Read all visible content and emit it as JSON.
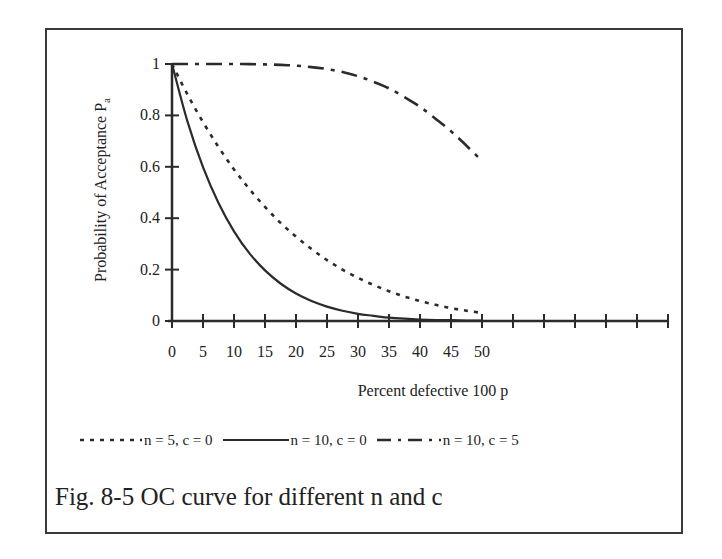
{
  "figure": {
    "caption": "Fig. 8-5 OC curve for different n and c"
  },
  "chart_data": {
    "type": "line",
    "title": "",
    "xlabel": "Percent defective  100 p",
    "ylabel": "Probability of Acceptance P",
    "ylabel_subscript": "a",
    "xlim": [
      0,
      80
    ],
    "ylim": [
      0,
      1
    ],
    "grid": false,
    "legend_position": "bottom",
    "x_ticks": [
      0,
      5,
      10,
      15,
      20,
      25,
      30,
      35,
      40,
      45,
      50,
      55,
      60,
      65,
      70,
      75,
      80
    ],
    "x_tick_labels": [
      "0",
      "5",
      "10",
      "15",
      "20",
      "25",
      "30",
      "35",
      "40",
      "45",
      "50"
    ],
    "y_ticks": [
      0,
      0.2,
      0.4,
      0.6,
      0.8,
      1
    ],
    "y_tick_labels": [
      "0",
      "0.2",
      "0.4",
      "0.6",
      "0.8",
      "1"
    ],
    "x": [
      0,
      2.5,
      5,
      7.5,
      10,
      12.5,
      15,
      17.5,
      20,
      22.5,
      25,
      27.5,
      30,
      32.5,
      35,
      37.5,
      40,
      42.5,
      45,
      47.5,
      50
    ],
    "series": [
      {
        "name": "n = 5, c = 0",
        "style": "dotted",
        "values": [
          1.0,
          0.881,
          0.774,
          0.677,
          0.59,
          0.513,
          0.444,
          0.382,
          0.328,
          0.28,
          0.237,
          0.2,
          0.168,
          0.14,
          0.116,
          0.095,
          0.078,
          0.063,
          0.05,
          0.04,
          0.031
        ]
      },
      {
        "name": "n = 10, c = 0",
        "style": "solid",
        "values": [
          1.0,
          0.776,
          0.599,
          0.459,
          0.349,
          0.263,
          0.197,
          0.146,
          0.107,
          0.078,
          0.056,
          0.04,
          0.028,
          0.02,
          0.013,
          0.009,
          0.006,
          0.004,
          0.003,
          0.002,
          0.001
        ]
      },
      {
        "name": "n = 10, c = 5",
        "style": "dash-dot",
        "values": [
          1.0,
          1.0,
          1.0,
          1.0,
          0.9999,
          0.9995,
          0.9986,
          0.9966,
          0.9936,
          0.9881,
          0.9803,
          0.9689,
          0.9527,
          0.9309,
          0.9051,
          0.8711,
          0.8338,
          0.7871,
          0.7384,
          0.682,
          0.623
        ]
      }
    ]
  },
  "legend": {
    "items": [
      {
        "label": "n = 5, c = 0",
        "style": "dotted"
      },
      {
        "label": "n = 10, c = 0",
        "style": "solid"
      },
      {
        "label": "n = 10, c = 5",
        "style": "dash-dot"
      }
    ]
  },
  "colors": {
    "ink": "#2b2b2b",
    "frame": "#3a3a3a",
    "background": "#ffffff"
  }
}
